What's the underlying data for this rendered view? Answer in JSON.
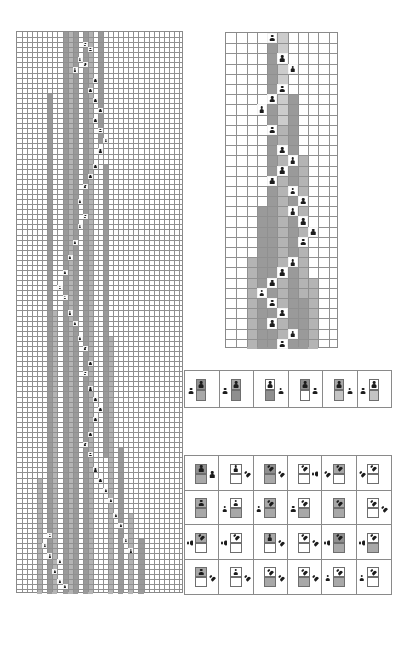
{
  "figure": {
    "panel_labels": {
      "left": "",
      "right": "",
      "legend_strip": "",
      "legend_matrix": ""
    }
  },
  "colors": {
    "grid_line": "#909090",
    "panel_border": "#8a8a8a",
    "shade_dark": "#9a9a9a",
    "shade_mid": "#b4b4b4",
    "shade_light": "#cccccc",
    "agent": "#1c1c1c",
    "background": "#ffffff"
  },
  "left_panel": {
    "name": "left-grid",
    "x": 16,
    "y": 31,
    "width": 167,
    "height": 562,
    "cols": 33,
    "rows": 111,
    "cell_w": 5.06,
    "cell_h": 5.06,
    "shaded_columns": [
      {
        "col": 9,
        "row_start": 0,
        "row_end": 111,
        "tone": "sh-dark"
      },
      {
        "col": 10,
        "row_start": 0,
        "row_end": 111,
        "tone": "sh-mid"
      },
      {
        "col": 11,
        "row_start": 0,
        "row_end": 111,
        "tone": "sh-dark"
      },
      {
        "col": 13,
        "row_start": 0,
        "row_end": 111,
        "tone": "sh-dark"
      },
      {
        "col": 14,
        "row_start": 0,
        "row_end": 111,
        "tone": "sh-mid"
      },
      {
        "col": 6,
        "row_start": 12,
        "row_end": 111,
        "tone": "sh-dark"
      },
      {
        "col": 7,
        "row_start": 55,
        "row_end": 111,
        "tone": "sh-mid"
      },
      {
        "col": 16,
        "row_start": 0,
        "row_end": 22,
        "tone": "sh-dark"
      },
      {
        "col": 17,
        "row_start": 26,
        "row_end": 84,
        "tone": "sh-dark"
      },
      {
        "col": 18,
        "row_start": 60,
        "row_end": 111,
        "tone": "sh-mid"
      },
      {
        "col": 20,
        "row_start": 82,
        "row_end": 111,
        "tone": "sh-dark"
      },
      {
        "col": 22,
        "row_start": 95,
        "row_end": 111,
        "tone": "sh-mid"
      },
      {
        "col": 24,
        "row_start": 100,
        "row_end": 111,
        "tone": "sh-dark"
      },
      {
        "col": 4,
        "row_start": 88,
        "row_end": 111,
        "tone": "sh-mid"
      }
    ],
    "agents": [
      {
        "col": 13,
        "row": 2
      },
      {
        "col": 14,
        "row": 3
      },
      {
        "col": 12,
        "row": 5
      },
      {
        "col": 13,
        "row": 6
      },
      {
        "col": 11,
        "row": 7
      },
      {
        "col": 15,
        "row": 9
      },
      {
        "col": 14,
        "row": 11
      },
      {
        "col": 15,
        "row": 13
      },
      {
        "col": 16,
        "row": 15
      },
      {
        "col": 15,
        "row": 17
      },
      {
        "col": 16,
        "row": 19
      },
      {
        "col": 17,
        "row": 21
      },
      {
        "col": 16,
        "row": 23
      },
      {
        "col": 15,
        "row": 26
      },
      {
        "col": 14,
        "row": 28
      },
      {
        "col": 13,
        "row": 30
      },
      {
        "col": 12,
        "row": 33
      },
      {
        "col": 13,
        "row": 36
      },
      {
        "col": 12,
        "row": 38
      },
      {
        "col": 11,
        "row": 41
      },
      {
        "col": 10,
        "row": 44
      },
      {
        "col": 9,
        "row": 47
      },
      {
        "col": 8,
        "row": 50
      },
      {
        "col": 9,
        "row": 52
      },
      {
        "col": 10,
        "row": 55
      },
      {
        "col": 11,
        "row": 57
      },
      {
        "col": 12,
        "row": 60
      },
      {
        "col": 13,
        "row": 62
      },
      {
        "col": 14,
        "row": 65
      },
      {
        "col": 13,
        "row": 67
      },
      {
        "col": 14,
        "row": 70
      },
      {
        "col": 15,
        "row": 72
      },
      {
        "col": 16,
        "row": 74
      },
      {
        "col": 15,
        "row": 76
      },
      {
        "col": 14,
        "row": 79
      },
      {
        "col": 13,
        "row": 81
      },
      {
        "col": 14,
        "row": 83
      },
      {
        "col": 15,
        "row": 86
      },
      {
        "col": 16,
        "row": 88
      },
      {
        "col": 17,
        "row": 90
      },
      {
        "col": 18,
        "row": 92
      },
      {
        "col": 19,
        "row": 95
      },
      {
        "col": 20,
        "row": 97
      },
      {
        "col": 21,
        "row": 100
      },
      {
        "col": 22,
        "row": 102
      },
      {
        "col": 8,
        "row": 104
      },
      {
        "col": 7,
        "row": 106
      },
      {
        "col": 8,
        "row": 108
      },
      {
        "col": 9,
        "row": 109
      },
      {
        "col": 6,
        "row": 99
      },
      {
        "col": 5,
        "row": 101
      },
      {
        "col": 6,
        "row": 103
      }
    ]
  },
  "right_panel": {
    "name": "right-grid",
    "x": 225,
    "y": 32,
    "width": 113,
    "height": 316,
    "cols": 11,
    "rows": 31,
    "cell_w": 10.27,
    "cell_h": 10.2,
    "shaded_columns": [
      {
        "col": 4,
        "row_start": 0,
        "row_end": 31,
        "tone": "sh-dark"
      },
      {
        "col": 5,
        "row_start": 0,
        "row_end": 31,
        "tone": "sh-light"
      },
      {
        "col": 5,
        "row_start": 9,
        "row_end": 31,
        "tone": "sh-mid"
      },
      {
        "col": 6,
        "row_start": 6,
        "row_end": 31,
        "tone": "sh-dark"
      },
      {
        "col": 3,
        "row_start": 17,
        "row_end": 31,
        "tone": "sh-dark"
      },
      {
        "col": 2,
        "row_start": 22,
        "row_end": 31,
        "tone": "sh-mid"
      },
      {
        "col": 7,
        "row_start": 12,
        "row_end": 26,
        "tone": "sh-mid"
      },
      {
        "col": 7,
        "row_start": 26,
        "row_end": 31,
        "tone": "sh-dark"
      },
      {
        "col": 8,
        "row_start": 24,
        "row_end": 31,
        "tone": "sh-mid"
      }
    ],
    "agents": [
      {
        "col": 4,
        "row": 0
      },
      {
        "col": 5,
        "row": 2
      },
      {
        "col": 6,
        "row": 3
      },
      {
        "col": 5,
        "row": 5
      },
      {
        "col": 4,
        "row": 6
      },
      {
        "col": 3,
        "row": 7
      },
      {
        "col": 4,
        "row": 9
      },
      {
        "col": 5,
        "row": 11
      },
      {
        "col": 6,
        "row": 12
      },
      {
        "col": 5,
        "row": 13
      },
      {
        "col": 4,
        "row": 14
      },
      {
        "col": 6,
        "row": 15
      },
      {
        "col": 7,
        "row": 16
      },
      {
        "col": 6,
        "row": 17
      },
      {
        "col": 7,
        "row": 18
      },
      {
        "col": 8,
        "row": 19
      },
      {
        "col": 7,
        "row": 20
      },
      {
        "col": 6,
        "row": 22
      },
      {
        "col": 5,
        "row": 23
      },
      {
        "col": 4,
        "row": 24
      },
      {
        "col": 3,
        "row": 25
      },
      {
        "col": 4,
        "row": 26
      },
      {
        "col": 5,
        "row": 27
      },
      {
        "col": 4,
        "row": 28
      },
      {
        "col": 6,
        "row": 29
      },
      {
        "col": 5,
        "row": 30
      }
    ]
  },
  "legend_strip": {
    "name": "legend-strip",
    "x": 184,
    "y": 370,
    "width": 208,
    "height": 38,
    "cells": [
      {
        "id": "ls-1",
        "top_tile": "t-dark",
        "bottom_tile": "t-mid",
        "side_pawn": "left",
        "side_pawn_rot": 0,
        "top_pawn": true
      },
      {
        "id": "ls-2",
        "top_tile": "t-mid",
        "bottom_tile": "t-dark",
        "side_pawn": "left",
        "side_pawn_rot": 0,
        "top_pawn": true
      },
      {
        "id": "ls-3",
        "top_tile": "t-white",
        "bottom_tile": "t-dark",
        "side_pawn": "right",
        "side_pawn_rot": 0,
        "top_pawn": true
      },
      {
        "id": "ls-4",
        "top_tile": "t-dark",
        "bottom_tile": "t-white",
        "side_pawn": "right",
        "side_pawn_rot": 0,
        "top_pawn": true
      },
      {
        "id": "ls-5",
        "top_tile": "t-mid",
        "bottom_tile": "t-light",
        "side_pawn": "right",
        "side_pawn_rot": 0,
        "top_pawn": true
      },
      {
        "id": "ls-6",
        "top_tile": "t-white",
        "bottom_tile": "t-light",
        "side_pawn": "left",
        "side_pawn_rot": 0,
        "top_pawn": true
      }
    ]
  },
  "legend_matrix": {
    "name": "legend-matrix",
    "x": 184,
    "y": 455,
    "width": 208,
    "height": 140,
    "cols": 6,
    "rows": 4,
    "cells": [
      {
        "id": "m-1-1",
        "top_tile": "t-dark",
        "bottom_tile": "t-mid",
        "top_pawn_rot": 0,
        "side_pawn": "right",
        "side_pawn_rot": 0
      },
      {
        "id": "m-1-2",
        "top_tile": "t-white",
        "bottom_tile": "t-white",
        "top_pawn_rot": 0,
        "side_pawn": "right",
        "side_pawn_rot": -45
      },
      {
        "id": "m-1-3",
        "top_tile": "t-dark",
        "bottom_tile": "t-mid",
        "top_pawn_rot": -45,
        "side_pawn": "right",
        "side_pawn_rot": -45
      },
      {
        "id": "m-1-4",
        "top_tile": "t-white",
        "bottom_tile": "t-white",
        "top_pawn_rot": -45,
        "side_pawn": "right",
        "side_pawn_rot": -90
      },
      {
        "id": "m-1-5",
        "top_tile": "t-mid",
        "bottom_tile": "t-white",
        "top_pawn_rot": -45,
        "side_pawn": "left",
        "side_pawn_rot": -45
      },
      {
        "id": "m-1-6",
        "top_tile": "t-white",
        "bottom_tile": "t-white",
        "top_pawn_rot": -45,
        "side_pawn": "left",
        "side_pawn_rot": -45
      },
      {
        "id": "m-2-1",
        "top_tile": "t-mid",
        "bottom_tile": "t-mid",
        "top_pawn_rot": 0,
        "side_pawn": "none",
        "side_pawn_rot": 0
      },
      {
        "id": "m-2-2",
        "top_tile": "t-white",
        "bottom_tile": "t-mid",
        "top_pawn_rot": 0,
        "side_pawn": "left",
        "side_pawn_rot": 0
      },
      {
        "id": "m-2-3",
        "top_tile": "t-mid",
        "bottom_tile": "t-mid",
        "top_pawn_rot": -45,
        "side_pawn": "left",
        "side_pawn_rot": 0
      },
      {
        "id": "m-2-4",
        "top_tile": "t-white",
        "bottom_tile": "t-mid",
        "top_pawn_rot": -45,
        "side_pawn": "left",
        "side_pawn_rot": 0
      },
      {
        "id": "m-2-5",
        "top_tile": "t-mid",
        "bottom_tile": "t-mid",
        "top_pawn_rot": -45,
        "side_pawn": "none",
        "side_pawn_rot": 0
      },
      {
        "id": "m-2-6",
        "top_tile": "t-white",
        "bottom_tile": "t-white",
        "top_pawn_rot": -45,
        "side_pawn": "right",
        "side_pawn_rot": -45
      },
      {
        "id": "m-3-1",
        "top_tile": "t-mid",
        "bottom_tile": "t-white",
        "top_pawn_rot": -45,
        "side_pawn": "left",
        "side_pawn_rot": -90
      },
      {
        "id": "m-3-2",
        "top_tile": "t-white",
        "bottom_tile": "t-white",
        "top_pawn_rot": -45,
        "side_pawn": "left",
        "side_pawn_rot": -90
      },
      {
        "id": "m-3-3",
        "top_tile": "t-mid",
        "bottom_tile": "t-white",
        "top_pawn_rot": 0,
        "side_pawn": "right",
        "side_pawn_rot": -45
      },
      {
        "id": "m-3-4",
        "top_tile": "t-white",
        "bottom_tile": "t-white",
        "top_pawn_rot": -45,
        "side_pawn": "right",
        "side_pawn_rot": -45
      },
      {
        "id": "m-3-5",
        "top_tile": "t-dark",
        "bottom_tile": "t-mid",
        "top_pawn_rot": -45,
        "side_pawn": "left",
        "side_pawn_rot": -90
      },
      {
        "id": "m-3-6",
        "top_tile": "t-white",
        "bottom_tile": "t-mid",
        "top_pawn_rot": -45,
        "side_pawn": "left",
        "side_pawn_rot": -90
      },
      {
        "id": "m-4-1",
        "top_tile": "t-mid",
        "bottom_tile": "t-white",
        "top_pawn_rot": 0,
        "side_pawn": "right",
        "side_pawn_rot": -45
      },
      {
        "id": "m-4-2",
        "top_tile": "t-white",
        "bottom_tile": "t-white",
        "top_pawn_rot": 0,
        "side_pawn": "right",
        "side_pawn_rot": -45
      },
      {
        "id": "m-4-3",
        "top_tile": "t-white",
        "bottom_tile": "t-mid",
        "top_pawn_rot": -45,
        "side_pawn": "right",
        "side_pawn_rot": -45
      },
      {
        "id": "m-4-4",
        "top_tile": "t-white",
        "bottom_tile": "t-mid",
        "top_pawn_rot": -45,
        "side_pawn": "right",
        "side_pawn_rot": -45
      },
      {
        "id": "m-4-5",
        "top_tile": "t-white",
        "bottom_tile": "t-mid",
        "top_pawn_rot": -45,
        "side_pawn": "left",
        "side_pawn_rot": 0
      },
      {
        "id": "m-4-6",
        "top_tile": "t-white",
        "bottom_tile": "t-white",
        "top_pawn_rot": -45,
        "side_pawn": "left",
        "side_pawn_rot": 0
      }
    ]
  }
}
